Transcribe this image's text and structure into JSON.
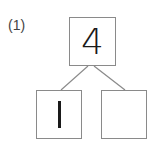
{
  "problem": {
    "label": "(1)",
    "top_value": "4",
    "left_value": "1",
    "right_value": ""
  },
  "colors": {
    "border": "#8a8a8a",
    "text": "#1a1a1a"
  }
}
